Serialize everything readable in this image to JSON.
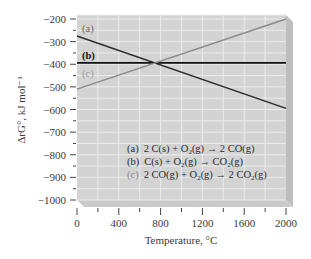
{
  "chart_data": {
    "type": "line",
    "title": "",
    "xlabel": "Temperature, °C",
    "ylabel": "ΔrG°, kJ mol⁻¹",
    "xlim": [
      0,
      2000
    ],
    "ylim": [
      -1000,
      -200
    ],
    "x_ticks": [
      0,
      400,
      800,
      1200,
      1600,
      2000
    ],
    "x_tick_labels": [
      "0",
      "400",
      "800",
      "1200",
      "1600",
      "2000"
    ],
    "y_ticks": [
      -200,
      -300,
      -400,
      -500,
      -600,
      -700,
      -800,
      -900,
      -1000
    ],
    "y_tick_labels": [
      "−200",
      "−300",
      "−400",
      "−500",
      "−600",
      "−700",
      "−800",
      "−900",
      "−1000"
    ],
    "grid": true,
    "x": [
      0,
      2000
    ],
    "series": [
      {
        "name": "(a) 2 C(s) + O2(g) → 2 CO(g)",
        "label": "(a)",
        "values": [
          -275,
          -595
        ],
        "color": "#2a2a2a"
      },
      {
        "name": "(b) C(s) + O2(g) → CO2(g)",
        "label": "(b)",
        "values": [
          -394,
          -394
        ],
        "color": "#111111"
      },
      {
        "name": "(c) 2 CO(g) + O2(g) → 2 CO2(g)",
        "label": "(c)",
        "values": [
          -510,
          -200
        ],
        "color": "#8a8a8a"
      }
    ],
    "annotations": [
      "lines intersect near 730 °C at about −394 kJ mol⁻¹"
    ],
    "legend_position": "lower right inside plot"
  },
  "labels": {
    "a": "(a)",
    "b": "(b)",
    "c": "(c)"
  },
  "legend": {
    "a_tag": "(a)",
    "b_tag": "(b)",
    "c_tag": "(c)"
  }
}
